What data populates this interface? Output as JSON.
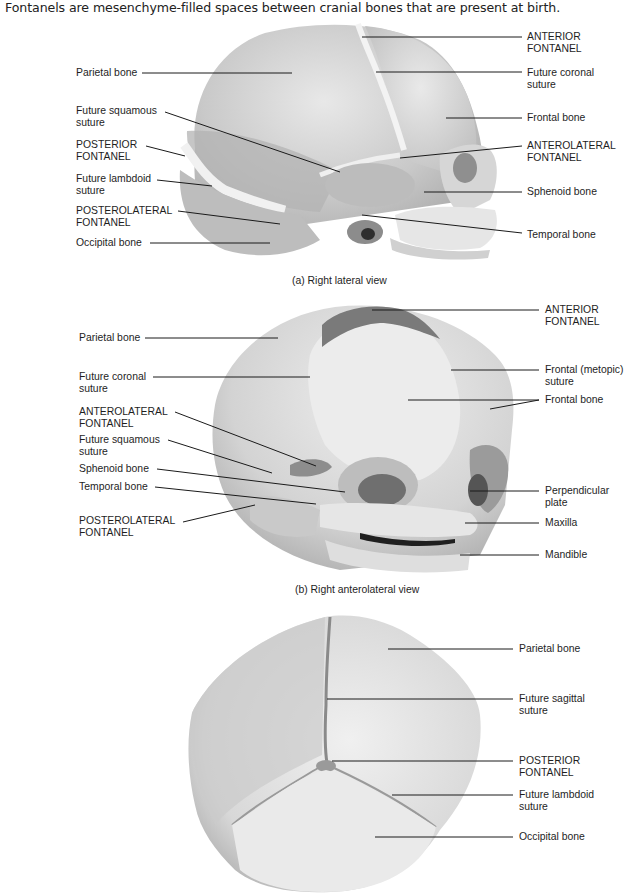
{
  "intro": "Fontanels are mesenchyme-filled spaces between cranial bones that are present at birth.",
  "panels": {
    "a": {
      "caption": "(a) Right lateral view",
      "left_labels": [
        {
          "l1": "Parietal bone",
          "l2": ""
        },
        {
          "l1": "Future squamous",
          "l2": "suture"
        },
        {
          "l1": "POSTERIOR",
          "l2": "FONTANEL"
        },
        {
          "l1": "Future lambdoid",
          "l2": "suture"
        },
        {
          "l1": "POSTEROLATERAL",
          "l2": "FONTANEL"
        },
        {
          "l1": "Occipital bone",
          "l2": ""
        }
      ],
      "right_labels": [
        {
          "l1": "ANTERIOR",
          "l2": "FONTANEL"
        },
        {
          "l1": "Future coronal",
          "l2": "suture"
        },
        {
          "l1": "Frontal bone",
          "l2": ""
        },
        {
          "l1": "ANTEROLATERAL",
          "l2": "FONTANEL"
        },
        {
          "l1": "Sphenoid bone",
          "l2": ""
        },
        {
          "l1": "Temporal bone",
          "l2": ""
        }
      ]
    },
    "b": {
      "caption": "(b) Right anterolateral view",
      "left_labels": [
        {
          "l1": "Parietal bone",
          "l2": ""
        },
        {
          "l1": "Future coronal",
          "l2": "suture"
        },
        {
          "l1": "ANTEROLATERAL",
          "l2": "FONTANEL"
        },
        {
          "l1": "Future squamous",
          "l2": "suture"
        },
        {
          "l1": "Sphenoid bone",
          "l2": ""
        },
        {
          "l1": "Temporal bone",
          "l2": ""
        },
        {
          "l1": "POSTEROLATERAL",
          "l2": "FONTANEL"
        }
      ],
      "right_labels": [
        {
          "l1": "ANTERIOR",
          "l2": "FONTANEL"
        },
        {
          "l1": "Frontal (metopic)",
          "l2": "suture"
        },
        {
          "l1": "Frontal bone",
          "l2": ""
        },
        {
          "l1": "Perpendicular",
          "l2": "plate"
        },
        {
          "l1": "Maxilla",
          "l2": ""
        },
        {
          "l1": "Mandible",
          "l2": ""
        }
      ]
    },
    "c": {
      "caption": "",
      "right_labels": [
        {
          "l1": "Parietal bone",
          "l2": ""
        },
        {
          "l1": "Future sagittal",
          "l2": "suture"
        },
        {
          "l1": "POSTERIOR",
          "l2": "FONTANEL"
        },
        {
          "l1": "Future lambdoid",
          "l2": "suture"
        },
        {
          "l1": "Occipital bone",
          "l2": ""
        }
      ]
    }
  },
  "colors": {
    "bone_light": "#e2e2e2",
    "bone_mid": "#c4c4c4",
    "bone_dark": "#9a9a9a",
    "suture_light": "#f2f2f2",
    "fontanel_dark": "#7d7d7d",
    "leader_line": "#1a1a1a"
  }
}
